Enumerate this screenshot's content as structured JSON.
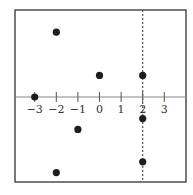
{
  "chart_data": {
    "type": "scatter",
    "title": "",
    "xlabel": "",
    "ylabel": "",
    "x_ticks": [
      -3,
      -2,
      -1,
      0,
      1,
      2,
      3
    ],
    "x_tick_labels": [
      "−3",
      "−2",
      "−1",
      "0",
      "1",
      "2",
      "3"
    ],
    "xlim": [
      -3.95,
      4.0
    ],
    "ylim": [
      -4.0,
      4.0
    ],
    "grid": false,
    "legend": null,
    "points": [
      {
        "x": -3,
        "y": 0
      },
      {
        "x": -2,
        "y": 3
      },
      {
        "x": 0,
        "y": 1
      },
      {
        "x": 2,
        "y": 1
      },
      {
        "x": 2,
        "y": -1
      },
      {
        "x": -1,
        "y": -1.5
      },
      {
        "x": 2,
        "y": -3
      },
      {
        "x": -2,
        "y": -3.5
      }
    ],
    "reference_lines": [
      {
        "orientation": "vertical",
        "x": 2,
        "style": "dashed"
      }
    ],
    "colors": {
      "points": "#1e1e1e",
      "frame": "#333333",
      "axis": "#888888",
      "dashed_line": "#555555"
    }
  }
}
